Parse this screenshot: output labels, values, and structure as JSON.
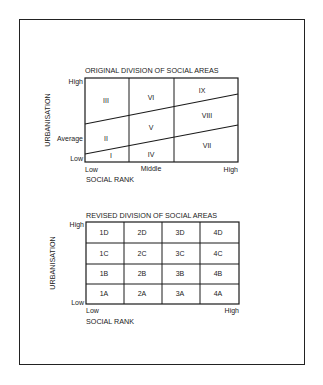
{
  "figure": {
    "top_diagram": {
      "title": "ORIGINAL DIVISION OF SOCIAL AREAS",
      "y_axis_label": "URBANISATION",
      "y_ticks": [
        "High",
        "Average",
        "Low"
      ],
      "x_axis_label": "SOCIAL RANK",
      "x_ticks": [
        "Low",
        "Middle",
        "High"
      ],
      "areas": [
        "I",
        "II",
        "III",
        "IV",
        "V",
        "VI",
        "VII",
        "VIII",
        "IX"
      ]
    },
    "bottom_diagram": {
      "title": "REVISED DIVISION  OF SOCIAL AREAS",
      "y_axis_label": "URBANISATION",
      "y_ticks": [
        "High",
        "Low"
      ],
      "x_axis_label": "SOCIAL RANK",
      "x_ticks": [
        "Low",
        "High"
      ],
      "grid": [
        [
          "1D",
          "2D",
          "3D",
          "4D"
        ],
        [
          "1C",
          "2C",
          "3C",
          "4C"
        ],
        [
          "1B",
          "2B",
          "3B",
          "4B"
        ],
        [
          "1A",
          "2A",
          "3A",
          "4A"
        ]
      ]
    }
  },
  "colors": {
    "line": "#1a1a1a",
    "background": "#ffffff"
  }
}
